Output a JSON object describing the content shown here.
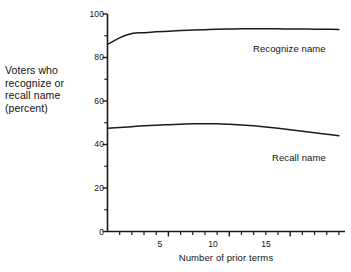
{
  "chart_data": {
    "type": "line",
    "title": "",
    "subtitle": "",
    "xlabel": "Number of prior terms",
    "ylabel": "Voters who recognize or recall name (percent)",
    "ylabel_lines": [
      "Voters who",
      "recognize or",
      "recall name",
      "(percent)"
    ],
    "xlim": [
      0,
      19.5
    ],
    "ylim": [
      0,
      100
    ],
    "grid": false,
    "legend_position": "inline-annotation",
    "y_ticks_major": [
      0,
      20,
      40,
      60,
      80,
      100
    ],
    "y_ticks_minor": [
      10,
      30,
      50,
      70,
      90
    ],
    "y_tick_labels": [
      "0",
      "20",
      "40",
      "60",
      "80",
      "100"
    ],
    "x_ticks_major": [
      5,
      10,
      15
    ],
    "x_tick_labels": [
      "5",
      "10",
      "15"
    ],
    "x_ticks_minor": [
      1,
      2,
      3,
      4,
      6,
      7,
      8,
      9,
      11,
      12,
      13,
      14,
      16,
      17,
      18,
      19
    ],
    "x": [
      0,
      1,
      2,
      3,
      4,
      5,
      6,
      7,
      8,
      9,
      10,
      11,
      12,
      13,
      14,
      15,
      16,
      17,
      18,
      19
    ],
    "series": [
      {
        "name": "Recognize name",
        "label": "Recognize name",
        "color": "#1a1a1a",
        "values": [
          86.0,
          89.0,
          91.0,
          91.4,
          91.8,
          92.1,
          92.4,
          92.6,
          92.8,
          93.0,
          93.1,
          93.2,
          93.2,
          93.2,
          93.2,
          93.1,
          93.1,
          93.0,
          93.0,
          92.9
        ]
      },
      {
        "name": "Recall name",
        "label": "Recall name",
        "color": "#1a1a1a",
        "values": [
          47.5,
          47.8,
          48.2,
          48.6,
          48.9,
          49.1,
          49.3,
          49.5,
          49.5,
          49.5,
          49.3,
          49.0,
          48.6,
          48.1,
          47.5,
          46.8,
          46.1,
          45.4,
          44.7,
          44.0
        ]
      }
    ],
    "annotations": [
      {
        "text": "Recognize name",
        "x_px": 253,
        "y_px": 43
      },
      {
        "text": "Recall name",
        "x_px": 272,
        "y_px": 152
      }
    ],
    "axis_color": "#1a1a1a",
    "line_color": "#1a1a1a",
    "background": "#ffffff"
  }
}
